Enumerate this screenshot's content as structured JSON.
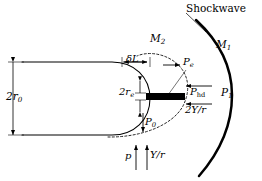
{
  "figure": {
    "background_color": "#ffffff",
    "line_color": "#000000",
    "width": 262,
    "height": 181
  },
  "labels": {
    "shockwave": "Shockwave",
    "mach_outer": "M",
    "mach_outer_sub": "1",
    "mach_inner": "M",
    "mach_inner_sub": "2",
    "pressure_freestream": "P",
    "pressure_freestream_sub": "1",
    "pressure_hd": "P",
    "pressure_hd_sub": "hd",
    "tension_term": "2Y/r",
    "pressure_exit": "P",
    "pressure_exit_sub": "e",
    "pressure_stagnation": "P",
    "pressure_stagnation_sub": "0",
    "diameter_exit": "2r",
    "diameter_exit_sub": "e",
    "diameter_body": "2r",
    "diameter_body_sub": "0",
    "standoff": "δL",
    "pressure_internal": "p",
    "tension_single": "Y/r"
  },
  "icon_names": {
    "arrow_right": "arrow-right-icon",
    "arrow_left": "arrow-left-icon",
    "arrow_up": "arrow-up-icon",
    "arrow_down": "arrow-down-icon",
    "dimension_double": "dimension-double-arrow-icon",
    "leader_line": "leader-line-icon"
  },
  "geometry": {
    "body_top_y": 62,
    "body_bottom_y": 135,
    "body_left_x": 22,
    "nose_apex_x": 150,
    "shock_apex_x": 232,
    "jet_bar": {
      "x": 146,
      "y": 93,
      "width": 39,
      "height": 7
    }
  }
}
